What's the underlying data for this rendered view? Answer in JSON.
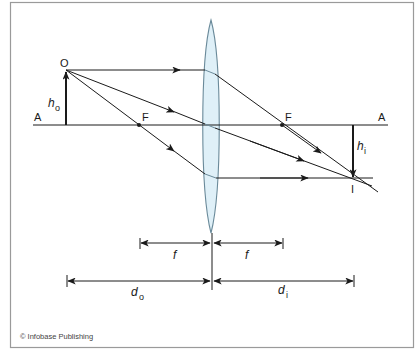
{
  "diagram": {
    "axis": {
      "left_label": "A",
      "right_label": "A"
    },
    "object": {
      "point_label": "O",
      "height_label": "h",
      "height_subscript": "o"
    },
    "image": {
      "point_label": "I",
      "height_label": "h",
      "height_subscript": "i"
    },
    "focal_points": {
      "left_label": "F",
      "right_label": "F"
    },
    "dimensions": {
      "focal_left": "f",
      "focal_right": "f",
      "object_distance": "d",
      "object_distance_subscript": "o",
      "image_distance": "d",
      "image_distance_subscript": "i"
    },
    "colors": {
      "lens_fill": "#dff0f8",
      "lens_stroke": "#6a8a9a",
      "line": "#1a1a1a",
      "frame": "#9a9a9a"
    },
    "credit": "© Infobase Publishing"
  }
}
